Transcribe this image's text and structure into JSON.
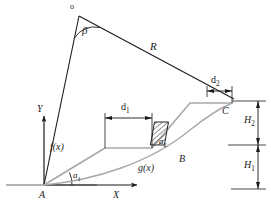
{
  "figure": {
    "background_color": "#ffffff",
    "line_color": "#1a1a1a",
    "profile_color": "#a8a8a8",
    "width": 271,
    "height": 216
  },
  "labels": {
    "apex_point": "o",
    "beta_angle": "β",
    "radius": "R",
    "d2": "d",
    "d2_sub": "2",
    "d1": "d",
    "d1_sub": "1",
    "point_c": "C",
    "point_b": "B",
    "point_a": "A",
    "h2": "H",
    "h2_sub": "2",
    "h1": "H",
    "h1_sub": "1",
    "axis_y": "Y",
    "axis_x": "X",
    "f_of_x": "f(x)",
    "g_of_x": "g(x)",
    "a1": "a",
    "a1_sub": "1",
    "a2": "a",
    "a2_sub": "2"
  },
  "geometry": {
    "origin_A": [
      44,
      185
    ],
    "apex_o": [
      79,
      15
    ],
    "point_C": [
      228,
      104
    ],
    "point_B_marker": [
      183,
      136
    ],
    "d1_left": [
      105,
      117
    ],
    "d1_right": [
      152,
      117
    ],
    "d2_left": [
      207,
      91
    ],
    "d2_right": [
      232,
      91
    ],
    "h_right_axis_x": 261,
    "h_mid_y": 145,
    "h_top_y": 101,
    "h_bottom_y": 189
  }
}
